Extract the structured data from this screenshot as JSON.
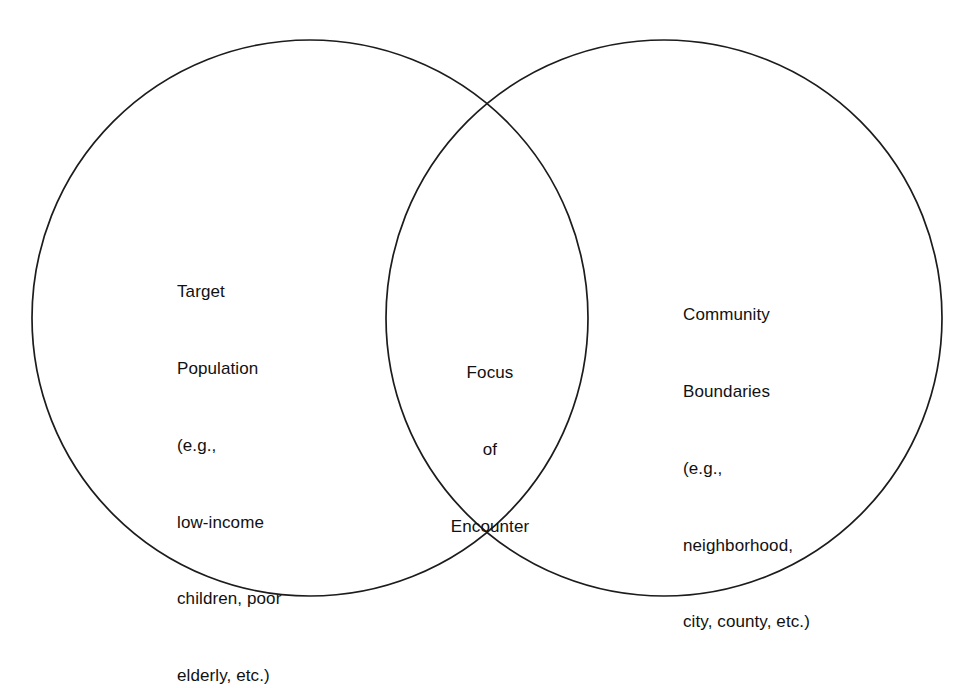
{
  "diagram": {
    "type": "venn",
    "background_color": "#ffffff",
    "stroke_color": "#1c1c1c",
    "text_color": "#111111",
    "sets": [
      {
        "name": "target-population",
        "position": "left",
        "lines": [
          "Target",
          "Population",
          "(e.g.,",
          "low-income",
          "children, poor",
          "elderly, etc.)"
        ]
      },
      {
        "name": "community-boundaries",
        "position": "right",
        "lines": [
          "Community",
          "Boundaries",
          "(e.g.,",
          "neighborhood,",
          "city, county, etc.)"
        ]
      },
      {
        "name": "intersection",
        "position": "center",
        "lines": [
          "Focus",
          "of",
          "Encounter"
        ]
      }
    ]
  },
  "left": {
    "line1": "Target",
    "line2": "Population",
    "line3": "(e.g.,",
    "line4": "low-income",
    "line5": "children, poor",
    "line6": "elderly, etc.)"
  },
  "right": {
    "line1": "Community",
    "line2": "Boundaries",
    "line3": "(e.g.,",
    "line4": "neighborhood,",
    "line5": "city, county, etc.)"
  },
  "center": {
    "line1": "Focus",
    "line2": "of",
    "line3": "Encounter"
  }
}
